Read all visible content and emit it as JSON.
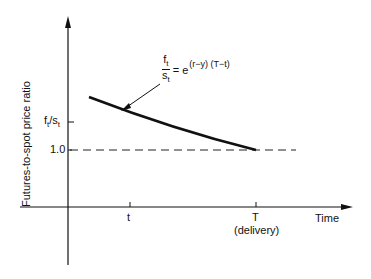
{
  "diagram": {
    "y_axis_label": "Futures-to-spot price ratio",
    "x_axis_label": "Time",
    "y_ticks": [
      {
        "label": "f",
        "sub": "t",
        "label2": "/s",
        "sub2": "t"
      },
      {
        "label": "1.0"
      }
    ],
    "x_ticks": [
      {
        "label": "t"
      },
      {
        "label": "T",
        "sublabel": "(delivery)"
      }
    ],
    "equation": {
      "numerator": "f",
      "numerator_sub": "t",
      "denominator": "s",
      "denominator_sub": "t",
      "equals": "= e",
      "exponent": "(r−y) (T−t)"
    }
  }
}
